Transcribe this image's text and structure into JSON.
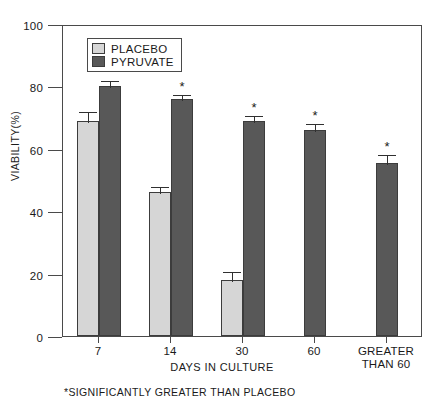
{
  "chart_data": {
    "type": "bar",
    "title": "",
    "xlabel": "DAYS IN CULTURE",
    "ylabel": "VIABILITY(%)",
    "ylim": [
      0,
      100
    ],
    "yticks": [
      0,
      20,
      40,
      60,
      80,
      100
    ],
    "ytick_labels": [
      "0",
      "20",
      "40",
      "60",
      "80",
      "100"
    ],
    "grid": false,
    "legend_position": "top-left-inside",
    "categories": [
      "7",
      "14",
      "30",
      "60",
      "GREATER THAN 60"
    ],
    "category_labels": [
      {
        "line1": "7",
        "line2": ""
      },
      {
        "line1": "14",
        "line2": ""
      },
      {
        "line1": "30",
        "line2": ""
      },
      {
        "line1": "60",
        "line2": ""
      },
      {
        "line1": "GREATER",
        "line2": "THAN 60"
      }
    ],
    "series": [
      {
        "name": "PLACEBO",
        "color": "#d6d6d6",
        "values": [
          69,
          46,
          18,
          null,
          null
        ],
        "errors": [
          3.5,
          2.5,
          3.0,
          null,
          null
        ],
        "significant": [
          false,
          false,
          false,
          false,
          false
        ]
      },
      {
        "name": "PYRUVATE",
        "color": "#585858",
        "values": [
          80,
          76,
          69,
          66,
          55.5
        ],
        "errors": [
          2.5,
          2.0,
          2.0,
          2.5,
          3.0
        ],
        "significant": [
          false,
          true,
          true,
          true,
          true
        ]
      }
    ],
    "annotations": [
      "*SIGNIFICANTLY GREATER THAN PLACEBO"
    ],
    "significance_marker": "*"
  },
  "legend": {
    "items": [
      {
        "label": "PLACEBO",
        "color": "#d6d6d6"
      },
      {
        "label": "PYRUVATE",
        "color": "#585858"
      }
    ]
  },
  "footnote": {
    "text": "*SIGNIFICANTLY GREATER THAN PLACEBO"
  },
  "axes": {
    "y_title": "VIABILITY(%)",
    "x_title": "DAYS IN CULTURE"
  }
}
